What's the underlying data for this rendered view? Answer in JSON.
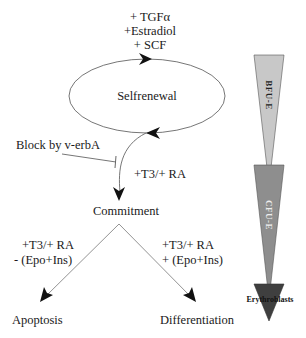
{
  "diagram": {
    "factors_top": [
      "+ TGFα",
      "+Estradiol",
      "+ SCF"
    ],
    "cycle_label": "Selfrenewal",
    "block_label": "Block by v-erbA",
    "commitment_signal": "+T3/+ RA",
    "commitment_label": "Commitment",
    "left_branch": {
      "signal_line1": "+T3/+ RA",
      "signal_line2": "- (Epo+Ins)",
      "outcome": "Apoptosis"
    },
    "right_branch": {
      "signal_line1": "+T3/+ RA",
      "signal_line2": "+ (Epo+Ins)",
      "outcome": "Differentiation"
    },
    "stages": [
      {
        "label": "BFU-E",
        "color": "#c8c8c8"
      },
      {
        "label": "CFU-E",
        "color": "#8e8e8e"
      },
      {
        "label": "Erythroblasts",
        "color": "#3f3f3f"
      }
    ]
  }
}
